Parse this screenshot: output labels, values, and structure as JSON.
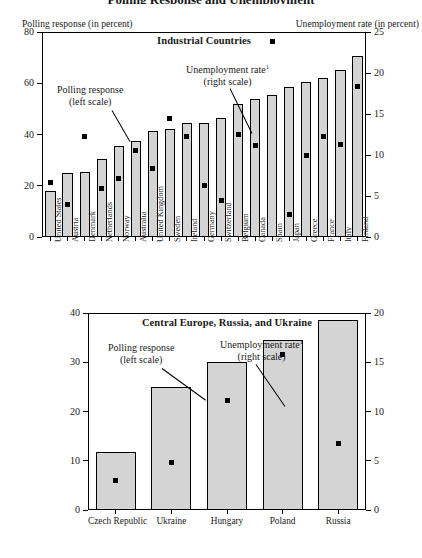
{
  "figure": {
    "cut_title": "Polling Response and Unemployment",
    "left_axis_caption": "Polling response (in percent)",
    "right_axis_caption": "Unemployment rate (in percent)"
  },
  "annotations": {
    "polling_line1": "Polling response",
    "polling_line2": "(left scale)",
    "unemp_line1": "Unemployment rate",
    "unemp_sup": "1",
    "unemp_line2": "(right scale)"
  },
  "chart_data": [
    {
      "type": "bar",
      "title": "Industrial Countries",
      "xlabel": "",
      "ylabel": "Polling response (in percent)",
      "y2label": "Unemployment rate (in percent)",
      "ylim": [
        0,
        80
      ],
      "y2lim": [
        0,
        25
      ],
      "yticks": [
        0,
        20,
        40,
        60,
        80
      ],
      "y2ticks": [
        0,
        5,
        10,
        15,
        20,
        25
      ],
      "grid": false,
      "legend": "annotated",
      "categories": [
        "United States",
        "Austria",
        "Denmark",
        "Netherlands",
        "Norway",
        "Australia",
        "United Kingdom",
        "Sweden",
        "Ireland",
        "Germany",
        "Switzerland",
        "Belgium",
        "Canada",
        "Spain",
        "Japan",
        "Greece",
        "France",
        "Italy",
        "Finland"
      ],
      "series": [
        {
          "name": "Polling response (left scale)",
          "axis": "left",
          "mark": "bar",
          "values": [
            18,
            25,
            25.5,
            30.5,
            35.5,
            37.5,
            41.5,
            42,
            44.5,
            44.5,
            46.5,
            52,
            54,
            55.5,
            58.5,
            60.5,
            62,
            65,
            70.5
          ]
        },
        {
          "name": "Unemployment rate (right scale)",
          "axis": "right",
          "mark": "square",
          "values": [
            6.6,
            4.0,
            12.2,
            5.9,
            7.1,
            10.5,
            8.3,
            14.4,
            12.2,
            6.3,
            4.5,
            12.5,
            11.1,
            23.8,
            2.8,
            10.0,
            12.2,
            11.3,
            18.4
          ]
        }
      ]
    },
    {
      "type": "bar",
      "title": "Central Europe, Russia, and Ukraine",
      "xlabel": "",
      "ylabel": "Polling response (in percent)",
      "y2label": "Unemployment rate (in percent)",
      "ylim": [
        0,
        40
      ],
      "y2lim": [
        0,
        20
      ],
      "yticks": [
        0,
        10,
        20,
        30,
        40
      ],
      "y2ticks": [
        0,
        5,
        10,
        15,
        20
      ],
      "grid": false,
      "legend": "annotated",
      "categories": [
        "Czech Republic",
        "Ukraine",
        "Hungary",
        "Poland",
        "Russia"
      ],
      "series": [
        {
          "name": "Polling response (left scale)",
          "axis": "left",
          "mark": "bar",
          "values": [
            11.8,
            25.0,
            30.0,
            34.5,
            38.5
          ]
        },
        {
          "name": "Unemployment rate (right scale)",
          "axis": "right",
          "mark": "square",
          "values": [
            3.0,
            4.8,
            11.1,
            15.8,
            6.8
          ]
        }
      ]
    }
  ]
}
